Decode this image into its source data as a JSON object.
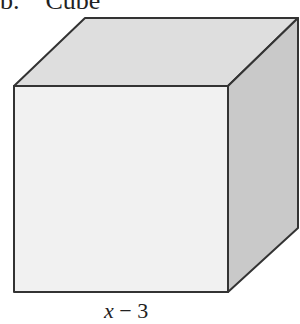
{
  "title": {
    "prefix": "b.",
    "text": "Cube"
  },
  "cube": {
    "faces": {
      "front": {
        "color": "#f1f1f1",
        "points": "14,86 228,86 228,292 14,292"
      },
      "top": {
        "color": "#dedede",
        "points": "14,86 85,18 298,18 228,86"
      },
      "right": {
        "color": "#c9c9c9",
        "points": "228,86 298,18 298,228 228,292"
      }
    },
    "edge_color": "#333333"
  },
  "dimension_label": {
    "variable": "x",
    "operator": "−",
    "constant": "3"
  }
}
